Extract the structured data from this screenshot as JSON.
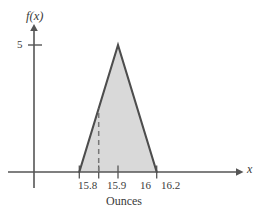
{
  "figure": {
    "y_axis_label": "f(x)",
    "x_axis_label": "x",
    "x_axis_title": "Ounces",
    "y_tick_label": "5",
    "x_tick_labels": [
      "15.8",
      "15.9",
      "16",
      "16.2"
    ],
    "colors": {
      "axis": "#555555",
      "curve": "#4d4d4d",
      "fill": "#d9d9d9",
      "dashed": "#777777",
      "text": "#3a3a3a",
      "background": "#ffffff"
    }
  },
  "chart_data": {
    "type": "area",
    "title": "",
    "subtitle": "",
    "xlabel": "Ounces",
    "ylabel": "f(x)",
    "xlim": [
      15.7,
      16.45
    ],
    "ylim": [
      0,
      6
    ],
    "grid": false,
    "legend": null,
    "xticks": [
      15.8,
      15.9,
      16.0,
      16.2
    ],
    "xtick_labels": [
      "15.8",
      "15.9",
      "16",
      "16.2"
    ],
    "yticks": [
      5
    ],
    "ytick_labels": [
      "5"
    ],
    "series": [
      {
        "name": "triangular density f(x)",
        "x": [
          15.8,
          16.0,
          16.2
        ],
        "values": [
          0,
          5,
          0
        ],
        "shaded": true,
        "shade_color": "#d9d9d9"
      }
    ],
    "annotations": [
      {
        "type": "dashed-vertical-line",
        "x": 15.9,
        "y_from": 0,
        "y_to": 2.5,
        "label": ""
      }
    ]
  }
}
